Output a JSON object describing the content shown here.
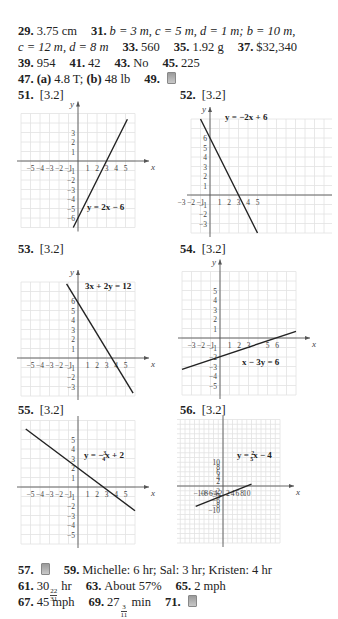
{
  "answers_top": [
    {
      "n": "29.",
      "text": "3.75 cm"
    },
    {
      "n": "31.",
      "text": "b = 3 m, c = 5 m, d = 1 m; b = 10 m,"
    },
    {
      "n": "",
      "text": "c = 12 m, d = 8 m"
    },
    {
      "n": "33.",
      "text": "560"
    },
    {
      "n": "35.",
      "text": "1.92 g"
    },
    {
      "n": "37.",
      "text": "$32,340"
    },
    {
      "n": "39.",
      "text": "954"
    },
    {
      "n": "41.",
      "text": "42"
    },
    {
      "n": "43.",
      "text": "No"
    },
    {
      "n": "45.",
      "text": "225"
    },
    {
      "n": "47.",
      "a": "(a)",
      "a_text": "4.8 T;",
      "b": "(b)",
      "b_text": "48 lb"
    },
    {
      "n": "49.",
      "icon": "calculator-icon"
    }
  ],
  "graph_headers": [
    {
      "n": "51.",
      "ref": "[3.2]"
    },
    {
      "n": "52.",
      "ref": "[3.2]"
    },
    {
      "n": "53.",
      "ref": "[3.2]"
    },
    {
      "n": "54.",
      "ref": "[3.2]"
    },
    {
      "n": "55.",
      "ref": "[3.2]"
    },
    {
      "n": "56.",
      "ref": "[3.2]"
    }
  ],
  "graphs": [
    {
      "id": "51",
      "equation": "y = 2x − 6",
      "x_ticks": [
        "−5",
        "−4",
        "−3",
        "−2",
        "−1",
        "1",
        "2",
        "3",
        "4",
        "5"
      ],
      "y_ticks": [
        "3",
        "2",
        "1",
        "−1",
        "−2",
        "−3",
        "−4",
        "−5",
        "−6"
      ],
      "axis_x": "x",
      "axis_y": "y"
    },
    {
      "id": "52",
      "equation": "y = −2x + 6",
      "x_ticks": [
        "−5",
        "−4",
        "−3",
        "−2",
        "−1",
        "1",
        "2",
        "3",
        "4",
        "5"
      ],
      "y_ticks": [
        "6",
        "5",
        "4",
        "3",
        "2",
        "1",
        "−1",
        "−2",
        "−3"
      ],
      "axis_x": "x",
      "axis_y": "y"
    },
    {
      "id": "53",
      "equation": "3x + 2y = 12",
      "x_ticks": [
        "−5",
        "−4",
        "−3",
        "−2",
        "−1",
        "1",
        "2",
        "3",
        "4",
        "5"
      ],
      "y_ticks": [
        "6",
        "5",
        "4",
        "3",
        "2",
        "1",
        "−1",
        "−2",
        "−3"
      ],
      "axis_x": "x",
      "axis_y": "y"
    },
    {
      "id": "54",
      "equation": "x − 3y = 6",
      "x_ticks": [
        "−3",
        "−2",
        "−1",
        "1",
        "2",
        "3",
        "5",
        "6"
      ],
      "y_ticks": [
        "5",
        "4",
        "3",
        "2",
        "1",
        "−1",
        "−2",
        "−3",
        "−4",
        "−5"
      ],
      "axis_x": "x",
      "axis_y": "y"
    },
    {
      "id": "55",
      "equation_pre": "y = −",
      "frac_num": "3",
      "frac_den": "4",
      "equation_post": "x + 2",
      "x_ticks": [
        "−5",
        "−4",
        "−3",
        "−2",
        "−1",
        "1",
        "2",
        "3",
        "4",
        "5"
      ],
      "y_ticks": [
        "5",
        "4",
        "3",
        "2",
        "1",
        "−1",
        "−2",
        "−3",
        "−4",
        "−5"
      ],
      "axis_x": "x",
      "axis_y": "y"
    },
    {
      "id": "56",
      "equation_pre": "y = ",
      "frac_num": "2",
      "frac_den": "5",
      "equation_post": "x − 4",
      "x_ticks": [
        "−10",
        "−8",
        "−6",
        "−4",
        "−2",
        "2",
        "4",
        "6",
        "8",
        "10"
      ],
      "y_ticks": [
        "10",
        "8",
        "6",
        "4",
        "2",
        "−2",
        "−4",
        "−6",
        "−8",
        "−10"
      ],
      "axis_x": "x",
      "axis_y": "y"
    }
  ],
  "answers_bottom": {
    "a57": {
      "n": "57."
    },
    "a59": {
      "n": "59.",
      "text": "Michelle: 6 hr; Sal: 3 hr; Kristen: 4 hr"
    },
    "a61": {
      "n": "61.",
      "whole": "30",
      "num": "22",
      "den": "31",
      "unit": "hr"
    },
    "a63": {
      "n": "63.",
      "text": "About 57%"
    },
    "a65": {
      "n": "65.",
      "text": "2 mph"
    },
    "a67": {
      "n": "67.",
      "text": "45 mph"
    },
    "a69": {
      "n": "69.",
      "whole": "27",
      "num": "3",
      "den": "11",
      "unit": "min"
    },
    "a71": {
      "n": "71."
    }
  }
}
